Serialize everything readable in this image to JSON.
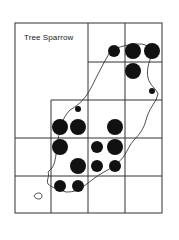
{
  "map": {
    "title": "Tree Sparrow",
    "frame": {
      "x1": 15,
      "y1": 23,
      "x2": 162,
      "y2": 213
    },
    "grid_lines": [
      {
        "x1": 88,
        "y1": 23,
        "x2": 88,
        "y2": 213
      },
      {
        "x1": 125,
        "y1": 23,
        "x2": 125,
        "y2": 213
      },
      {
        "x1": 51,
        "y1": 100,
        "x2": 51,
        "y2": 213
      },
      {
        "x1": 88,
        "y1": 62,
        "x2": 162,
        "y2": 62
      },
      {
        "x1": 51,
        "y1": 100,
        "x2": 162,
        "y2": 100
      },
      {
        "x1": 15,
        "y1": 138,
        "x2": 162,
        "y2": 138
      },
      {
        "x1": 15,
        "y1": 176,
        "x2": 162,
        "y2": 176
      }
    ],
    "dots": [
      {
        "x": 114,
        "y": 51,
        "r": 6,
        "size": "medium"
      },
      {
        "x": 133,
        "y": 51,
        "r": 8,
        "size": "large"
      },
      {
        "x": 152,
        "y": 51,
        "r": 8,
        "size": "large"
      },
      {
        "x": 133,
        "y": 71,
        "r": 8,
        "size": "large"
      },
      {
        "x": 152,
        "y": 91,
        "r": 3,
        "size": "small"
      },
      {
        "x": 78,
        "y": 109,
        "r": 3,
        "size": "small"
      },
      {
        "x": 60,
        "y": 127,
        "r": 8,
        "size": "large"
      },
      {
        "x": 78,
        "y": 127,
        "r": 8,
        "size": "large"
      },
      {
        "x": 115,
        "y": 127,
        "r": 8,
        "size": "large"
      },
      {
        "x": 60,
        "y": 147,
        "r": 8,
        "size": "large"
      },
      {
        "x": 97,
        "y": 147,
        "r": 6,
        "size": "medium"
      },
      {
        "x": 115,
        "y": 147,
        "r": 8,
        "size": "large"
      },
      {
        "x": 78,
        "y": 166,
        "r": 8,
        "size": "large"
      },
      {
        "x": 97,
        "y": 166,
        "r": 6,
        "size": "medium"
      },
      {
        "x": 115,
        "y": 166,
        "r": 6,
        "size": "medium"
      },
      {
        "x": 60,
        "y": 186,
        "r": 6,
        "size": "medium"
      },
      {
        "x": 78,
        "y": 186,
        "r": 6,
        "size": "medium"
      }
    ],
    "coastline": "M154,48 C150,60 146,68 148,78 C150,86 156,88 158,94 L156,100 C152,106 148,112 146,120 C144,128 140,134 134,140 C130,144 128,150 124,156 C120,162 112,168 104,172 C96,176 90,182 84,186 C80,190 74,192 66,192 C60,190 52,188 48,184 C46,180 50,176 48,172 L52,168 C56,162 56,152 58,140 C60,128 62,118 70,110 C80,104 86,98 92,86 C98,74 104,62 110,52 C118,46 130,44 142,44 Z",
    "islet": "M34,196 C36,192 42,192 42,196 C42,200 36,200 34,196 Z",
    "colors": {
      "ink": "#111111",
      "line": "#333333",
      "background": "#ffffff"
    }
  }
}
